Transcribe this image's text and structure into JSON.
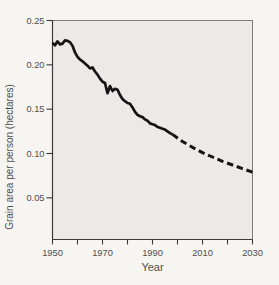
{
  "figure": {
    "x_axis_title": "Year",
    "y_axis_title": "Grain area per person (hectares)"
  },
  "chart_data": {
    "type": "line",
    "title": "",
    "xlabel": "Year",
    "ylabel": "Grain area per person (hectares)",
    "xlim": [
      1950,
      2030
    ],
    "ylim": [
      0.003,
      0.25
    ],
    "grid": false,
    "legend": "none",
    "x_label_years": [
      1950,
      1970,
      1990,
      2010,
      2030
    ],
    "x_tick_labels": [
      "1950",
      "1970",
      "1990",
      "2010",
      "2030"
    ],
    "x_minor_ticks": [
      1960,
      1980,
      2000,
      2020
    ],
    "y_ticks": [
      0.05,
      0.1,
      0.15,
      0.2,
      0.25
    ],
    "y_tick_labels": [
      "0.05",
      "0.10",
      "0.15",
      "0.20",
      "0.25"
    ],
    "series": [
      {
        "name": "historical",
        "style": "solid",
        "points": [
          [
            1950,
            0.2245
          ],
          [
            1951,
            0.222
          ],
          [
            1952,
            0.2265
          ],
          [
            1953,
            0.223
          ],
          [
            1954,
            0.224
          ],
          [
            1955,
            0.2275
          ],
          [
            1956,
            0.227
          ],
          [
            1957,
            0.2255
          ],
          [
            1958,
            0.2215
          ],
          [
            1959,
            0.214
          ],
          [
            1960,
            0.209
          ],
          [
            1961,
            0.206
          ],
          [
            1962,
            0.204
          ],
          [
            1963,
            0.2015
          ],
          [
            1964,
            0.199
          ],
          [
            1965,
            0.196
          ],
          [
            1966,
            0.197
          ],
          [
            1967,
            0.1925
          ],
          [
            1968,
            0.189
          ],
          [
            1969,
            0.1845
          ],
          [
            1970,
            0.181
          ],
          [
            1971,
            0.1795
          ],
          [
            1972,
            0.168
          ],
          [
            1973,
            0.176
          ],
          [
            1974,
            0.1705
          ],
          [
            1975,
            0.173
          ],
          [
            1976,
            0.172
          ],
          [
            1977,
            0.166
          ],
          [
            1978,
            0.1615
          ],
          [
            1979,
            0.159
          ],
          [
            1980,
            0.157
          ],
          [
            1981,
            0.156
          ],
          [
            1982,
            0.152
          ],
          [
            1983,
            0.147
          ],
          [
            1984,
            0.1435
          ],
          [
            1985,
            0.142
          ],
          [
            1986,
            0.141
          ],
          [
            1987,
            0.1385
          ],
          [
            1988,
            0.137
          ],
          [
            1989,
            0.134
          ],
          [
            1990,
            0.133
          ],
          [
            1991,
            0.132
          ],
          [
            1992,
            0.13
          ],
          [
            1993,
            0.129
          ],
          [
            1994,
            0.128
          ],
          [
            1995,
            0.127
          ],
          [
            1996,
            0.125
          ],
          [
            1997,
            0.123
          ],
          [
            1998,
            0.1215
          ]
        ]
      },
      {
        "name": "projected",
        "style": "dashed",
        "points": [
          [
            1998,
            0.1215
          ],
          [
            2002,
            0.1135
          ],
          [
            2006,
            0.107
          ],
          [
            2010,
            0.101
          ],
          [
            2014,
            0.096
          ],
          [
            2018,
            0.0912
          ],
          [
            2022,
            0.087
          ],
          [
            2026,
            0.083
          ],
          [
            2030,
            0.079
          ]
        ]
      }
    ]
  },
  "colors": {
    "page_bg": "#f6f5f2",
    "plot_bg": "#ebeae7",
    "plot_border": "#7d7d79",
    "axis": "#3a3a38",
    "line": "#141414",
    "text": "#4e4e4e"
  }
}
